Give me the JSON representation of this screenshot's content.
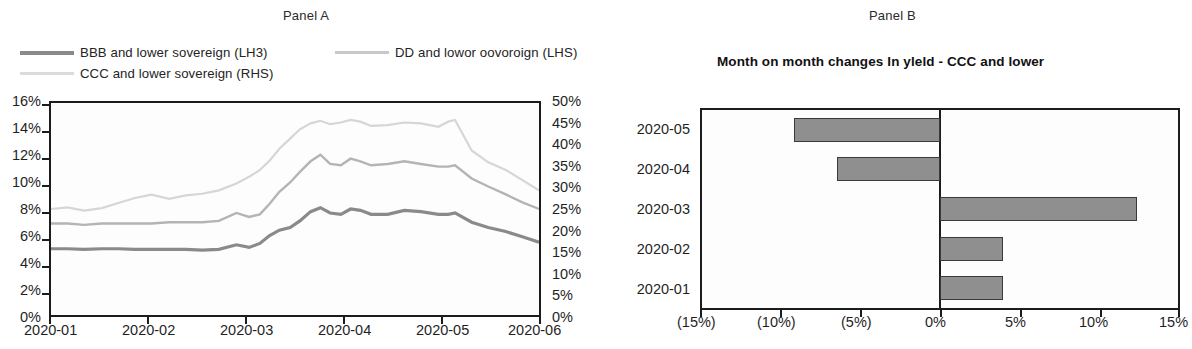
{
  "panel_a": {
    "panel_label": "Panel A",
    "legend": [
      {
        "label": "BBB and lower sovereign (LH3)",
        "color": "#8a8a8a",
        "key": "bbb"
      },
      {
        "label": "DD and lowor oovoroign (LHS)",
        "color": "#c2c2c2",
        "key": "bb"
      },
      {
        "label": "CCC and lower sovereign (RHS)",
        "color": "#dcdcdc",
        "key": "ccc"
      }
    ],
    "left_axis_ticks": [
      "16%",
      "14%",
      "12%",
      "10%",
      "8%",
      "6%",
      "4%",
      "2%",
      "0%"
    ],
    "right_axis_ticks": [
      "50%",
      "45%",
      "40%",
      "35%",
      "30%",
      "25%",
      "20%",
      "15%",
      "10%",
      "5%",
      "0%"
    ],
    "x_axis_ticks": [
      "2020-01",
      "2020-02",
      "2020-03",
      "2020-04",
      "2020-05",
      "2020-06"
    ]
  },
  "panel_b": {
    "panel_label": "Panel B",
    "title": "Month on month changes In yleld - CCC and lower",
    "categories": [
      "2020-05",
      "2020-04",
      "2020-03",
      "2020-02",
      "2020-01"
    ],
    "x_axis_ticks": [
      "(15%)",
      "(10%)",
      "(5%)",
      "0%",
      "5%",
      "10%",
      "15%"
    ],
    "bar_color": "#8f8f8f"
  },
  "chart_data": [
    {
      "type": "line",
      "title": "Panel A",
      "xlabel": "",
      "ylabel": "",
      "grid": false,
      "legend_position": "top",
      "x": [
        "2020-01",
        "2020-02",
        "2020-03",
        "2020-04",
        "2020-05",
        "2020-06"
      ],
      "xlim": [
        0,
        5
      ],
      "ylim_left": [
        0,
        16
      ],
      "ylim_right": [
        0,
        50
      ],
      "left_axis_ticks": [
        0,
        2,
        4,
        6,
        8,
        10,
        12,
        14,
        16
      ],
      "right_axis_ticks": [
        0,
        5,
        10,
        15,
        20,
        25,
        30,
        35,
        40,
        45,
        50
      ],
      "series": [
        {
          "name": "BBB and lower sovereign (LH3)",
          "axis": "left",
          "color": "#8a8a8a",
          "x": [
            0.0,
            0.17,
            0.34,
            0.52,
            0.69,
            0.86,
            1.03,
            1.21,
            1.38,
            1.55,
            1.72,
            1.9,
            2.03,
            2.14,
            2.24,
            2.34,
            2.45,
            2.55,
            2.66,
            2.76,
            2.86,
            2.97,
            3.07,
            3.17,
            3.28,
            3.45,
            3.62,
            3.79,
            3.97,
            4.07,
            4.14,
            4.31,
            4.48,
            4.66,
            4.83,
            5.0
          ],
          "values": [
            5.0,
            5.0,
            4.95,
            5.0,
            5.0,
            4.95,
            4.95,
            4.95,
            4.95,
            4.9,
            4.95,
            5.3,
            5.1,
            5.4,
            6.0,
            6.4,
            6.6,
            7.1,
            7.8,
            8.1,
            7.7,
            7.6,
            8.0,
            7.9,
            7.6,
            7.6,
            7.9,
            7.8,
            7.6,
            7.6,
            7.7,
            7.0,
            6.6,
            6.3,
            5.9,
            5.5
          ]
        },
        {
          "name": "DD and lowor oovoroign (LHS)",
          "axis": "left",
          "color": "#b4b4b4",
          "x": [
            0.0,
            0.17,
            0.34,
            0.52,
            0.69,
            0.86,
            1.03,
            1.21,
            1.38,
            1.55,
            1.72,
            1.9,
            2.03,
            2.14,
            2.24,
            2.34,
            2.45,
            2.55,
            2.66,
            2.76,
            2.86,
            2.97,
            3.07,
            3.17,
            3.28,
            3.45,
            3.62,
            3.79,
            3.97,
            4.07,
            4.14,
            4.31,
            4.48,
            4.66,
            4.83,
            5.0
          ],
          "values": [
            6.9,
            6.9,
            6.8,
            6.9,
            6.9,
            6.9,
            6.9,
            7.0,
            7.0,
            7.0,
            7.1,
            7.7,
            7.4,
            7.6,
            8.4,
            9.3,
            10.0,
            10.8,
            11.6,
            12.1,
            11.4,
            11.3,
            11.8,
            11.6,
            11.3,
            11.4,
            11.6,
            11.4,
            11.2,
            11.2,
            11.3,
            10.3,
            9.7,
            9.1,
            8.5,
            8.0
          ]
        },
        {
          "name": "CCC and lower sovereign (RHS)",
          "axis": "right",
          "color": "#d6d6d6",
          "x": [
            0.0,
            0.17,
            0.34,
            0.52,
            0.69,
            0.86,
            1.03,
            1.21,
            1.38,
            1.55,
            1.72,
            1.9,
            2.03,
            2.14,
            2.24,
            2.34,
            2.45,
            2.55,
            2.66,
            2.76,
            2.86,
            2.97,
            3.07,
            3.17,
            3.28,
            3.45,
            3.62,
            3.79,
            3.97,
            4.07,
            4.14,
            4.31,
            4.48,
            4.66,
            4.83,
            5.0
          ],
          "values": [
            25.0,
            25.4,
            24.6,
            25.2,
            26.4,
            27.6,
            28.4,
            27.4,
            28.2,
            28.6,
            29.4,
            31.0,
            32.6,
            34.2,
            36.4,
            39.2,
            41.6,
            43.8,
            45.2,
            45.8,
            45.0,
            45.4,
            46.0,
            45.6,
            44.6,
            44.8,
            45.4,
            45.2,
            44.4,
            45.6,
            46.0,
            38.8,
            36.0,
            34.2,
            31.8,
            29.4
          ]
        }
      ]
    },
    {
      "type": "bar",
      "orientation": "horizontal",
      "title": "Month on month changes In yleld - CCC and lower",
      "xlabel": "",
      "ylabel": "",
      "grid": false,
      "categories": [
        "2020-05",
        "2020-04",
        "2020-03",
        "2020-02",
        "2020-01"
      ],
      "values": [
        -9.2,
        -6.5,
        12.4,
        4.0,
        4.0
      ],
      "xlim": [
        -15,
        15
      ],
      "xticks": [
        -15,
        -10,
        -5,
        0,
        5,
        10,
        15
      ],
      "xticklabels": [
        "(15%)",
        "(10%)",
        "(5%)",
        "0%",
        "5%",
        "10%",
        "15%"
      ],
      "color": "#8f8f8f"
    }
  ]
}
